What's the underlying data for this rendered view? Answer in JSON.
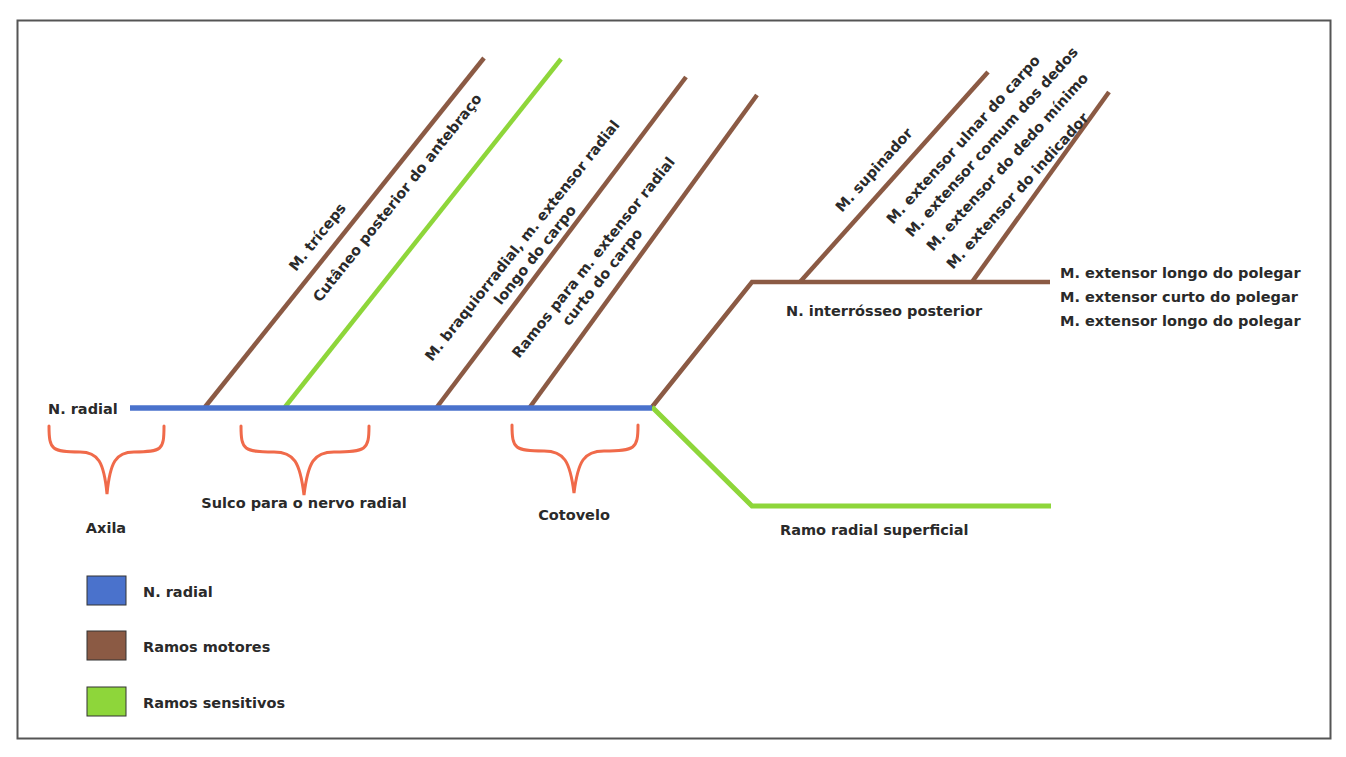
{
  "colors": {
    "radial": "#4a72cc",
    "motor": "#8b5a44",
    "sensory": "#8ed63a",
    "brace": "#f06a4a",
    "frame": "#555555",
    "text": "#2a2a2a"
  },
  "main_nerve": {
    "label": "N. radial"
  },
  "regions": [
    {
      "label": "Axila"
    },
    {
      "label": "Sulco para o nervo radial"
    },
    {
      "label": "Cotovelo"
    }
  ],
  "branches": [
    {
      "label": "M. tríceps",
      "type": "motor"
    },
    {
      "label": "Cutâneo posterior do antebraço",
      "type": "sensory"
    },
    {
      "label_line1": "M. braquiorradial, m. extensor radial",
      "label_line2": "longo do carpo",
      "type": "motor"
    },
    {
      "label_line1": "Ramos para m. extensor radial",
      "label_line2": "curto do carpo",
      "type": "motor"
    }
  ],
  "posterior_interosseous": {
    "label": "N. interrósseo posterior",
    "branches": [
      {
        "label": "M. supinador"
      },
      {
        "label_lines": [
          "M. extensor ulnar do carpo",
          "M. extensor comum dos dedos",
          "M. extensor do dedo mínimo",
          "M. extensor do indicador"
        ]
      }
    ],
    "terminal_labels": [
      "M. extensor longo do polegar",
      "M. extensor curto do polegar",
      "M. extensor longo do polegar"
    ]
  },
  "superficial_branch": {
    "label": "Ramo radial superficial"
  },
  "legend": {
    "items": [
      {
        "label": "N. radial",
        "color": "#4a72cc"
      },
      {
        "label": "Ramos motores",
        "color": "#8b5a44"
      },
      {
        "label": "Ramos sensitivos",
        "color": "#8ed63a"
      }
    ]
  }
}
